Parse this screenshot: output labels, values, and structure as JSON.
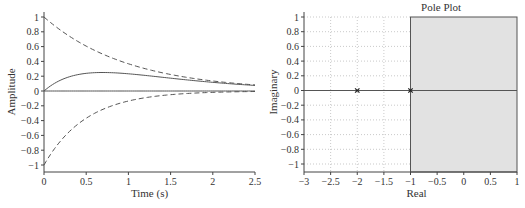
{
  "chart_data": [
    {
      "type": "line",
      "title": "",
      "xlabel": "Time (s)",
      "ylabel": "Amplitude",
      "xlim": [
        0,
        2.5
      ],
      "ylim": [
        -1.1,
        1.1
      ],
      "grid": false,
      "x_ticks": [
        "0",
        "0.5",
        "1",
        "1.5",
        "2",
        "2.5"
      ],
      "y_ticks": [
        "1",
        "0.8",
        "0.6",
        "0.4",
        "0.2",
        "0",
        "−0.2",
        "−0.4",
        "−0.6",
        "−0.8",
        "−1"
      ],
      "x": [
        0,
        0.25,
        0.5,
        0.75,
        1.0,
        1.25,
        1.5,
        1.75,
        2.0,
        2.25,
        2.5
      ],
      "series": [
        {
          "name": "upper envelope (dashed)",
          "style": "dashed",
          "values": [
            1.0,
            0.78,
            0.61,
            0.47,
            0.37,
            0.29,
            0.22,
            0.17,
            0.14,
            0.11,
            0.08
          ]
        },
        {
          "name": "response (solid)",
          "style": "solid",
          "values": [
            0.0,
            0.17,
            0.24,
            0.25,
            0.23,
            0.21,
            0.17,
            0.14,
            0.12,
            0.09,
            0.08
          ]
        },
        {
          "name": "lower envelope (dashed)",
          "style": "dashed",
          "values": [
            -1.0,
            -0.61,
            -0.37,
            -0.22,
            -0.14,
            -0.08,
            -0.05,
            -0.03,
            -0.02,
            -0.01,
            -0.01
          ]
        },
        {
          "name": "zero line",
          "style": "solid",
          "values": [
            0,
            0,
            0,
            0,
            0,
            0,
            0,
            0,
            0,
            0,
            0
          ]
        }
      ]
    },
    {
      "type": "scatter",
      "title": "Pole Plot",
      "xlabel": "Real",
      "ylabel": "Imaginary",
      "xlim": [
        -3,
        1
      ],
      "ylim": [
        -1.1,
        1.05
      ],
      "grid": true,
      "x_ticks": [
        "−3",
        "−2.5",
        "−2",
        "−1.5",
        "−1",
        "−0.5",
        "0",
        "0.5",
        "1"
      ],
      "y_ticks": [
        "1",
        "0.8",
        "0.6",
        "0.4",
        "0.2",
        "0",
        "−0.2",
        "−0.4",
        "−0.6",
        "−0.8",
        "−1"
      ],
      "points": [
        {
          "real": -2,
          "imag": 0,
          "marker": "x"
        },
        {
          "real": -1,
          "imag": 0,
          "marker": "x"
        }
      ],
      "shaded_region": {
        "real_from": -1,
        "real_to": 1,
        "color": "#e2e2e2"
      }
    }
  ]
}
